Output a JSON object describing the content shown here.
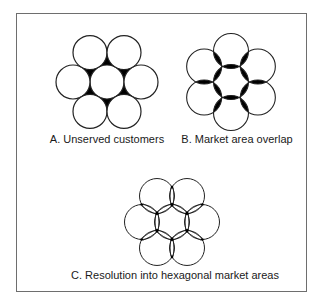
{
  "figure": {
    "panels": [
      {
        "id": "A",
        "label": "A. Unserved customers",
        "description": "Seven tangent circular market areas leaving unserved gaps (black)",
        "center": [
          107,
          82
        ],
        "radius": 17,
        "spacing": 34
      },
      {
        "id": "B",
        "label": "B. Market area overlap",
        "description": "Seven overlapping circular market areas with overlaps shaded black",
        "center": [
          231,
          82
        ],
        "radius": 17.5,
        "spacing": 31
      },
      {
        "id": "C",
        "label": "C. Resolution into hexagonal market areas",
        "description": "Overlapping circles resolved into hexagonal market boundaries",
        "center": [
          172,
          222
        ],
        "radius": 17.5,
        "spacing": 30
      }
    ],
    "colors": {
      "stroke": "#222222",
      "fill_gap": "#000000",
      "border": "#6e6e6e",
      "background": "#ffffff"
    }
  }
}
